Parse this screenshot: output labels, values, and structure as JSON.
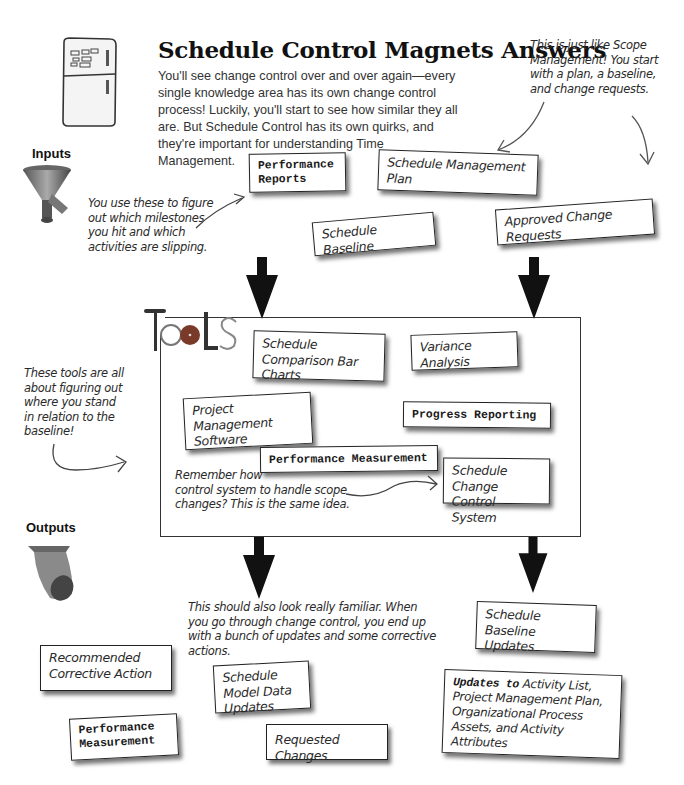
{
  "header": {
    "title": "Schedule Control Magnets Answers",
    "intro": "You'll see change control over and over again—every single knowledge area has its own change control process! Luckily, you'll start to see how similar they all are. But Schedule Control has its own quirks, and they're important for understanding Time Management.",
    "icon": "refrigerator-magnets-icon"
  },
  "annotations": {
    "scope_note": "This is just like Scope Management! You start with a plan, a baseline, and change requests.",
    "inputs_note": "You use these to figure out which milestones you hit and which activities are slipping.",
    "tools_note": "These tools are all about figuring out where you stand in relation to the baseline!",
    "change_control_note": "Remember how you used a change control system to handle scope changes? This is the same idea.",
    "change_control_note_visible": [
      "Remember how",
      "control system to handle scope",
      "changes? This is the same idea."
    ],
    "outputs_note": "This should also look really familiar. When you go through change control, you end up with a bunch of updates and some corrective actions."
  },
  "sections": {
    "inputs_label": "Inputs",
    "tools_label": "Tools",
    "outputs_label": "Outputs"
  },
  "inputs": [
    {
      "label": "Performance Reports",
      "style": "mono"
    },
    {
      "label": "Schedule Management Plan",
      "style": "hand"
    },
    {
      "label": "Schedule Baseline",
      "style": "hand"
    },
    {
      "label": "Approved Change Requests",
      "style": "hand"
    }
  ],
  "tools": [
    {
      "label": "Schedule Comparison Bar Charts",
      "style": "hand"
    },
    {
      "label": "Variance Analysis",
      "style": "hand"
    },
    {
      "label": "Project Management Software",
      "style": "hand"
    },
    {
      "label": "Progress Reporting",
      "style": "mono"
    },
    {
      "label": "Performance Measurement",
      "style": "mono"
    },
    {
      "label": "Schedule Change Control System",
      "style": "hand"
    }
  ],
  "outputs": [
    {
      "label": "Schedule Baseline Updates",
      "style": "hand"
    },
    {
      "label": "Recommended Corrective Action",
      "style": "hand"
    },
    {
      "label": "Schedule Model Data Updates",
      "style": "hand"
    },
    {
      "label": "Performance Measurement",
      "style": "mono"
    },
    {
      "label": "Requested Changes",
      "style": "hand"
    },
    {
      "label_prefix": "Updates to",
      "label": "Activity List, Project Management Plan, Organizational Process Assets, and Activity Attributes",
      "style": "mixed"
    }
  ]
}
